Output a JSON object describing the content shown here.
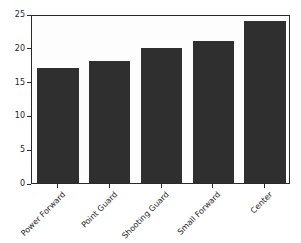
{
  "colors": {
    "bar": "#2f2f2f",
    "spine": "#2a2a2a",
    "text": "#262626",
    "plot_background": "#fdfdfd",
    "figure_background": "#ffffff"
  },
  "chart_data": {
    "type": "bar",
    "title": "",
    "xlabel": "",
    "ylabel": "",
    "categories": [
      "Power Forward",
      "Point Guard",
      "Shooting Guard",
      "Small Forward",
      "Center"
    ],
    "values": [
      17,
      18,
      20,
      21,
      24
    ],
    "ylim": [
      0,
      25
    ],
    "yticks": [
      0,
      5,
      10,
      15,
      20,
      25
    ],
    "xtick_rotation_deg": 45,
    "bar_width_fraction": 0.8,
    "grid": false,
    "legend": null
  }
}
